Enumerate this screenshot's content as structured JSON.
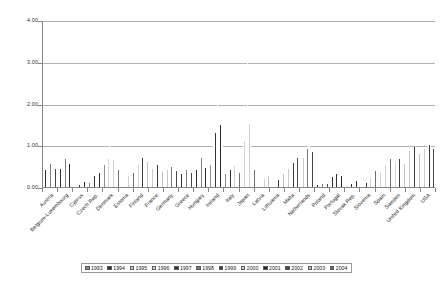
{
  "chart_data": {
    "type": "bar",
    "title": "",
    "xlabel": "",
    "ylabel": "",
    "ylim": [
      0,
      4
    ],
    "ytick_labels": [
      "0.00",
      "1.00",
      "2.00",
      "3.00",
      "4.00"
    ],
    "ytick_values": [
      0,
      1,
      2,
      3,
      4
    ],
    "grid": true,
    "legend_position": "bottom",
    "legend_entries": [
      "1993",
      "1994",
      "1995",
      "1996",
      "1997",
      "1998",
      "1999",
      "2000",
      "2001",
      "2002",
      "2003",
      "2004"
    ],
    "categories": [
      "Austria",
      "Belgium-Luxembourg",
      "Cyprus",
      "Czech Rep.",
      "Denmark",
      "Estonia",
      "Finland",
      "France",
      "Germany",
      "Greece",
      "Hungary",
      "Ireland",
      "Italy",
      "Japan",
      "Latvia",
      "Lithuania",
      "Malta",
      "Netherlands",
      "Poland",
      "Portugal",
      "Slovak Rep.",
      "Slovenia",
      "Spain",
      "Sweden",
      "United Kingdom",
      "USA"
    ],
    "series": [
      {
        "name": "1993",
        "values": [
          0.38,
          0.4,
          0.0,
          0.1,
          0.52,
          0.0,
          0.44,
          0.36,
          0.36,
          0.3,
          0.26,
          0.52,
          0.3,
          0.62,
          0.0,
          0.0,
          0.34,
          0.56,
          0.04,
          0.2,
          0.0,
          0.0,
          0.28,
          0.5,
          0.76,
          0.82
        ]
      },
      {
        "name": "1994",
        "values": [
          0.4,
          0.44,
          0.0,
          0.14,
          0.58,
          0.0,
          0.46,
          0.38,
          0.38,
          0.32,
          0.4,
          0.66,
          0.32,
          0.76,
          0.0,
          0.0,
          0.38,
          0.62,
          0.04,
          0.24,
          0.0,
          0.0,
          0.3,
          0.54,
          0.82,
          0.88
        ]
      },
      {
        "name": "1995",
        "values": [
          0.44,
          0.56,
          0.0,
          0.18,
          0.62,
          0.0,
          0.5,
          0.42,
          0.4,
          0.34,
          0.56,
          0.84,
          0.34,
          0.92,
          0.0,
          0.0,
          0.42,
          0.7,
          0.06,
          0.26,
          0.0,
          0.0,
          0.34,
          0.58,
          0.86,
          0.92
        ]
      },
      {
        "name": "1996",
        "values": [
          0.46,
          0.58,
          0.0,
          0.22,
          0.66,
          0.0,
          0.56,
          0.44,
          0.42,
          0.36,
          0.62,
          1.02,
          0.36,
          1.1,
          0.0,
          0.0,
          0.46,
          0.74,
          0.06,
          0.28,
          0.0,
          0.0,
          0.36,
          0.6,
          0.88,
          0.94
        ]
      },
      {
        "name": "1997",
        "values": [
          0.5,
          0.64,
          0.04,
          0.26,
          1.3,
          0.14,
          0.6,
          0.48,
          0.46,
          0.38,
          0.66,
          1.3,
          0.4,
          1.46,
          0.1,
          0.1,
          0.5,
          0.84,
          0.06,
          0.3,
          0.08,
          0.1,
          0.4,
          0.64,
          0.92,
          0.96
        ]
      },
      {
        "name": "1998",
        "values": [
          0.54,
          0.66,
          0.06,
          0.3,
          0.72,
          0.18,
          0.66,
          0.5,
          0.48,
          0.4,
          0.7,
          1.72,
          0.44,
          1.9,
          0.14,
          0.14,
          0.54,
          0.92,
          0.08,
          0.32,
          0.1,
          0.14,
          0.44,
          0.66,
          0.94,
          0.98
        ]
      },
      {
        "name": "1999",
        "values": [
          0.56,
          0.62,
          0.08,
          0.34,
          0.7,
          0.22,
          0.7,
          0.52,
          0.46,
          0.42,
          0.6,
          2.0,
          0.48,
          3.12,
          0.18,
          0.18,
          0.58,
          0.98,
          0.08,
          0.34,
          0.12,
          0.18,
          0.48,
          0.68,
          0.96,
          1.0
        ]
      },
      {
        "name": "2000",
        "values": [
          0.52,
          0.58,
          0.1,
          0.36,
          0.64,
          0.26,
          0.74,
          0.48,
          0.44,
          0.4,
          0.52,
          1.74,
          0.5,
          1.52,
          0.2,
          0.22,
          0.62,
          1.0,
          0.08,
          0.3,
          0.14,
          0.22,
          0.52,
          0.66,
          0.9,
          0.98
        ]
      },
      {
        "name": "2001",
        "values": [
          0.48,
          0.54,
          0.12,
          0.34,
          0.58,
          0.28,
          0.72,
          0.44,
          0.42,
          0.38,
          0.46,
          1.48,
          0.46,
          1.06,
          0.22,
          0.26,
          0.66,
          0.92,
          0.08,
          0.26,
          0.14,
          0.26,
          0.56,
          0.62,
          0.86,
          0.94
        ]
      },
      {
        "name": "2002",
        "values": [
          0.44,
          0.5,
          0.14,
          0.3,
          0.52,
          0.3,
          0.66,
          0.4,
          0.38,
          0.34,
          0.4,
          1.26,
          0.42,
          0.76,
          0.24,
          0.28,
          0.7,
          0.84,
          0.08,
          0.22,
          0.16,
          0.3,
          0.6,
          0.58,
          0.82,
          0.9
        ]
      },
      {
        "name": "2003",
        "values": [
          0.4,
          0.46,
          0.16,
          0.26,
          0.46,
          0.32,
          0.6,
          0.36,
          0.34,
          0.3,
          0.34,
          1.08,
          0.38,
          0.56,
          0.26,
          0.32,
          0.74,
          0.76,
          0.08,
          0.18,
          0.18,
          0.34,
          0.64,
          0.54,
          0.78,
          0.86
        ]
      },
      {
        "name": "2004",
        "values": [
          0.36,
          0.42,
          0.18,
          0.22,
          0.4,
          0.34,
          0.54,
          0.32,
          0.3,
          0.26,
          0.28,
          0.9,
          0.34,
          0.4,
          0.28,
          0.36,
          0.78,
          0.68,
          0.08,
          0.14,
          0.2,
          0.38,
          0.68,
          0.5,
          0.74,
          0.82
        ]
      }
    ]
  }
}
